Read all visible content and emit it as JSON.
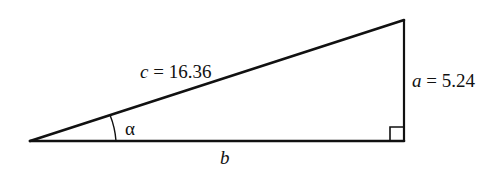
{
  "diagram": {
    "type": "right-triangle",
    "vertices": {
      "acute_vertex": [
        30,
        141
      ],
      "top_vertex": [
        404,
        20
      ],
      "right_angle_vertex": [
        404,
        141
      ]
    },
    "labels": {
      "hypotenuse_var": "c",
      "hypotenuse_eq": " = 16.36",
      "opposite_var": "a",
      "opposite_eq": " = 5.24",
      "adjacent_var": "b",
      "angle": "α"
    },
    "values": {
      "c": 16.36,
      "a": 5.24
    },
    "stroke_color": "#111111"
  }
}
